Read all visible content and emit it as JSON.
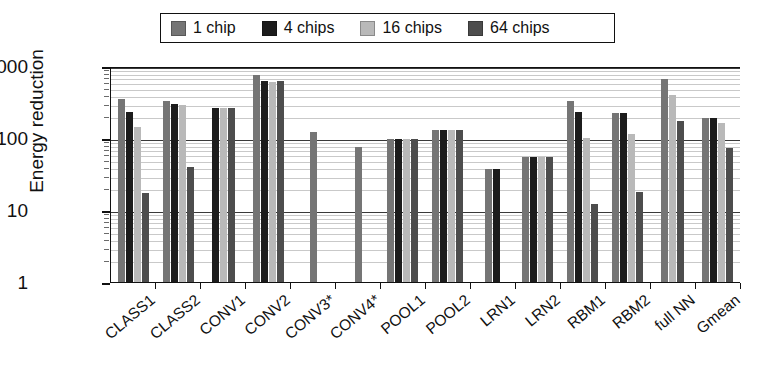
{
  "chart_data": {
    "type": "bar",
    "title": "",
    "subtitle": "",
    "xlabel": "",
    "ylabel": "Energy reduction",
    "yscale": "log",
    "ylim": [
      1,
      1000
    ],
    "yticks": [
      1,
      10,
      100,
      1000
    ],
    "ytick_labels": [
      "1",
      "10",
      "100",
      "1000"
    ],
    "grid": "horizontal-minor-log",
    "legend_position": "top-center",
    "categories": [
      "CLASS1",
      "CLASS2",
      "CONV1",
      "CONV2",
      "CONV3*",
      "CONV4*",
      "POOL1",
      "POOL2",
      "LRN1",
      "LRN2",
      "RBM1",
      "RBM2",
      "full NN",
      "Gmean"
    ],
    "series": [
      {
        "name": "1 chip",
        "color": "#757575",
        "values": [
          350,
          330,
          null,
          750,
          120,
          75,
          98,
          130,
          37,
          55,
          330,
          225,
          650,
          190
        ]
      },
      {
        "name": "4 chips",
        "color": "#1c1c1c",
        "values": [
          230,
          300,
          260,
          620,
          null,
          null,
          98,
          130,
          37,
          55,
          230,
          225,
          null,
          190
        ]
      },
      {
        "name": "16 chips",
        "color": "#b9b9b9",
        "values": [
          140,
          290,
          260,
          600,
          null,
          null,
          98,
          130,
          null,
          55,
          100,
          115,
          400,
          160
        ]
      },
      {
        "name": "64 chips",
        "color": "#4d4d4d",
        "values": [
          17,
          40,
          260,
          610,
          null,
          null,
          98,
          130,
          null,
          55,
          12,
          18,
          170,
          72
        ]
      }
    ]
  },
  "legend": {
    "entries": [
      {
        "label": "1 chip",
        "color": "#757575"
      },
      {
        "label": "4 chips",
        "color": "#1c1c1c"
      },
      {
        "label": "16 chips",
        "color": "#b9b9b9"
      },
      {
        "label": "64 chips",
        "color": "#4d4d4d"
      }
    ]
  },
  "axes": {
    "y_title": "Energy reduction",
    "y_tick_labels": [
      "1000",
      "100",
      "10",
      "1"
    ],
    "x_tick_labels": [
      "CLASS1",
      "CLASS2",
      "CONV1",
      "CONV2",
      "CONV3*",
      "CONV4*",
      "POOL1",
      "POOL2",
      "LRN1",
      "LRN2",
      "RBM1",
      "RBM2",
      "full NN",
      "Gmean"
    ]
  }
}
